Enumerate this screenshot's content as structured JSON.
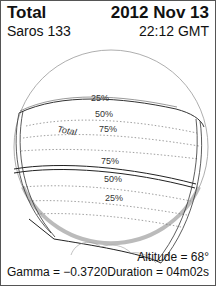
{
  "header": {
    "eclipse_type": "Total",
    "date": "2012 Nov 13",
    "saros": "Saros 133",
    "time": "22:12 GMT"
  },
  "footer": {
    "altitude": "Altitude = 68°",
    "gamma": "Gamma = −0.3720",
    "duration": "Duration = 04m02s"
  },
  "map": {
    "north_labels": [
      "25%",
      "50%",
      "75%"
    ],
    "path_label": "Total",
    "south_labels": [
      "75%",
      "50%",
      "25%"
    ]
  }
}
